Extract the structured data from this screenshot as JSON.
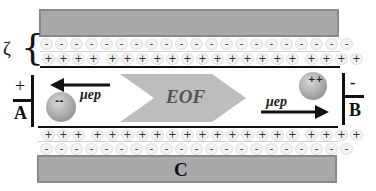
{
  "diagram": {
    "zeta_label": "ζ",
    "top_wall": {
      "label": ""
    },
    "bottom_wall": {
      "label": "C"
    },
    "top_layer": {
      "negative_row": {
        "symbol": "-",
        "count": 21
      },
      "positive_row": {
        "symbol": "+",
        "count": 21
      }
    },
    "bottom_layer": {
      "positive_row": {
        "symbol": "+",
        "count": 21
      },
      "negative_row": {
        "symbol": "-",
        "count": 21
      }
    },
    "left_electrode": {
      "polarity": "+",
      "label": "A"
    },
    "right_electrode": {
      "polarity": "-",
      "label": "B"
    },
    "flow_arrow": {
      "label": "EOF",
      "direction": "right"
    },
    "anion": {
      "charge_label": "--",
      "mobility_label": "μep",
      "arrow_direction": "left"
    },
    "cation": {
      "charge_label": "++",
      "mobility_label": "μep",
      "arrow_direction": "right"
    },
    "colors": {
      "wall": "#a9a9a9",
      "wall_border": "#8a8a8a",
      "eof_arrow": "#bdbdbd",
      "eof_text": "#555555",
      "ion_fill": "#f2f2f2",
      "line": "#111111"
    }
  }
}
